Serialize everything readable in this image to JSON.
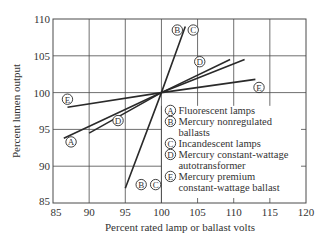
{
  "chart_data": {
    "type": "line",
    "title": "",
    "xlabel": "Percent rated lamp or ballast volts",
    "ylabel": "Percent lumen output",
    "xlim": [
      85,
      120
    ],
    "ylim": [
      85,
      110
    ],
    "xticks": [
      85,
      90,
      95,
      100,
      105,
      110,
      115,
      120
    ],
    "yticks": [
      85,
      90,
      95,
      100,
      105,
      110
    ],
    "grid": true,
    "legend_position": "inside-lower-right",
    "series": [
      {
        "id": "A",
        "name": "Fluorescent lamps",
        "x": [
          86.5,
          100,
          111.5
        ],
        "y": [
          93.8,
          100,
          104.5
        ],
        "label_at": [
          87.5,
          93.3
        ]
      },
      {
        "id": "B",
        "name": "Mercury nonregulated ballasts",
        "x": [
          95,
          100,
          103.3
        ],
        "y": [
          87,
          100,
          109
        ],
        "label_at": [
          97.2,
          87.5
        ],
        "label_top_at": [
          102.2,
          108.5
        ]
      },
      {
        "id": "C",
        "name": "Incandescent lamps",
        "x": [
          95,
          100,
          103.3
        ],
        "y": [
          87,
          100,
          109
        ],
        "label_at": [
          99.2,
          87.5
        ],
        "label_top_at": [
          104.4,
          108.5
        ]
      },
      {
        "id": "D",
        "name": "Mercury constant-wattage autotransformer",
        "x": [
          90,
          100,
          109.5
        ],
        "y": [
          94.5,
          100,
          104.5
        ],
        "label_at": [
          94,
          96.2
        ],
        "label_top_at": [
          105.3,
          104.2
        ]
      },
      {
        "id": "E",
        "name": "Mercury premium constant-wattage ballast",
        "x": [
          87,
          100,
          113
        ],
        "y": [
          98,
          100,
          101.8
        ],
        "label_at": [
          87,
          99.1
        ],
        "label_top_at": [
          113.5,
          100.7
        ]
      }
    ],
    "legend": [
      {
        "marker": "A",
        "text": [
          "Fluorescent lamps"
        ]
      },
      {
        "marker": "B",
        "text": [
          "Mercury nonregulated",
          "ballasts"
        ]
      },
      {
        "marker": "C",
        "text": [
          "Incandescent lamps"
        ]
      },
      {
        "marker": "D",
        "text": [
          "Mercury constant-wattage",
          "autotransformer"
        ]
      },
      {
        "marker": "E",
        "text": [
          "Mercury premium",
          "constant-wattage ballast"
        ]
      }
    ]
  },
  "colors": {
    "line": "#2a2a2a",
    "grid": "#4a4a4a",
    "text": "#333333",
    "background": "#ffffff"
  }
}
